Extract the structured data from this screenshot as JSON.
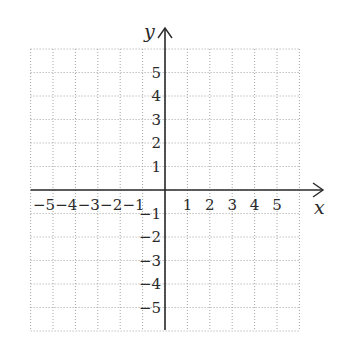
{
  "chart_data": {
    "type": "coordinate-grid",
    "title": "",
    "xlabel": "x",
    "ylabel": "y",
    "xlim": [
      -6,
      6
    ],
    "ylim": [
      -6,
      6
    ],
    "grid": true,
    "grid_style": "dotted",
    "x_tick_labels": [
      "-5",
      "-4",
      "-3",
      "-2",
      "-1",
      "1",
      "2",
      "3",
      "4",
      "5"
    ],
    "x_tick_values": [
      -5,
      -4,
      -3,
      -2,
      -1,
      1,
      2,
      3,
      4,
      5
    ],
    "y_tick_labels": [
      "5",
      "4",
      "3",
      "2",
      "1",
      "-1",
      "-2",
      "-3",
      "-4",
      "-5"
    ],
    "y_tick_values": [
      5,
      4,
      3,
      2,
      1,
      -1,
      -2,
      -3,
      -4,
      -5
    ],
    "series": []
  },
  "colors": {
    "grid": "#9a9a9a",
    "axis": "#2a2a2a",
    "text": "#2a2a2a"
  },
  "labels": {
    "x_axis": "x",
    "y_axis": "y"
  }
}
